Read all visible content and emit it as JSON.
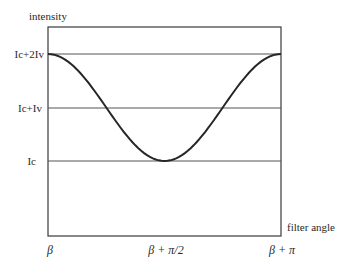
{
  "chart_data": {
    "type": "line",
    "title": "",
    "xlabel": "filter angle",
    "ylabel": "intensity",
    "x_tick_labels": [
      "β",
      "β + π/2",
      "β + π"
    ],
    "y_tick_labels": [
      "Ic",
      "Ic+Iv",
      "Ic+2Iv"
    ],
    "xlim": [
      0,
      1
    ],
    "ylim": [
      0,
      1
    ],
    "grid": "horizontal reference lines at Ic, Ic+Iv, Ic+2Iv",
    "legend": null,
    "series": [
      {
        "name": "intensity vs filter angle",
        "description": "cosine-shaped curve: I = Ic + Iv(1 + cos(2(θ-β)))",
        "x": [
          0,
          0.125,
          0.25,
          0.375,
          0.5,
          0.625,
          0.75,
          0.875,
          1.0
        ],
        "x_labels": [
          "β",
          "",
          "",
          "",
          "β + π/2",
          "",
          "",
          "",
          "β + π"
        ],
        "values_in_Iv_above_Ic": [
          2.0,
          1.71,
          1.0,
          0.29,
          0.0,
          0.29,
          1.0,
          1.71,
          2.0
        ]
      }
    ],
    "colors": {
      "curve": "#262626",
      "frame": "#3a3a3a",
      "reference_lines": "#555555"
    }
  },
  "labels": {
    "y_axis_title": "intensity",
    "x_axis_title": "filter angle",
    "y_ticks": {
      "top": "Ic+2Iv",
      "mid": "Ic+Iv",
      "low": "Ic"
    },
    "x_ticks": {
      "start": "β",
      "mid": "β + π/2",
      "end": "β + π"
    }
  }
}
